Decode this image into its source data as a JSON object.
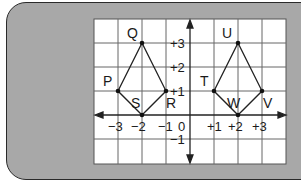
{
  "figure": {
    "colors": {
      "frame_bg": "#a8a8a8",
      "grid_bg": "#ffffff",
      "grid_line": "#555555",
      "shape_line": "#222222"
    }
  },
  "axes": {
    "x_ticks": [
      {
        "value": -3,
        "label": "−3"
      },
      {
        "value": -2,
        "label": "−2"
      },
      {
        "value": -1,
        "label": "−1"
      },
      {
        "value": 0,
        "label": "0"
      },
      {
        "value": 1,
        "label": "+1"
      },
      {
        "value": 2,
        "label": "+2"
      },
      {
        "value": 3,
        "label": "+3"
      }
    ],
    "y_ticks": [
      {
        "value": 3,
        "label": "+3"
      },
      {
        "value": 2,
        "label": "+2"
      },
      {
        "value": 1,
        "label": "+1"
      },
      {
        "value": -1,
        "label": "−1"
      }
    ]
  },
  "shapes": {
    "kite_left": {
      "points": [
        {
          "name": "P",
          "x": -3,
          "y": 1
        },
        {
          "name": "Q",
          "x": -2,
          "y": 3
        },
        {
          "name": "R",
          "x": -1,
          "y": 1
        },
        {
          "name": "S",
          "x": -2,
          "y": 0
        }
      ]
    },
    "kite_right": {
      "points": [
        {
          "name": "T",
          "x": 1,
          "y": 1
        },
        {
          "name": "U",
          "x": 2,
          "y": 3
        },
        {
          "name": "V",
          "x": 3,
          "y": 1
        },
        {
          "name": "W",
          "x": 2,
          "y": 0
        }
      ]
    }
  }
}
